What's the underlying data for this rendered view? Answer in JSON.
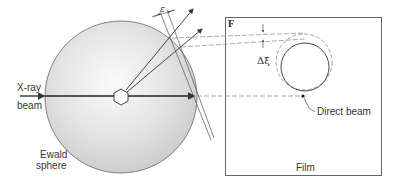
{
  "figure": {
    "labels": {
      "xray_line1": "X-ray",
      "xray_line2": "beam",
      "ewald_line1": "Ewald",
      "ewald_line2": "sphere",
      "film_corner": "F",
      "delta_xi": "Δξ",
      "epsilon": "ε",
      "direct_beam": "Direct beam",
      "film": "Film"
    },
    "colors": {
      "sphere_fill_light": "#f4f4f4",
      "sphere_fill_dark": "#cfcfcf",
      "line": "#333333",
      "dashed": "#777777",
      "frame": "#666666"
    }
  }
}
